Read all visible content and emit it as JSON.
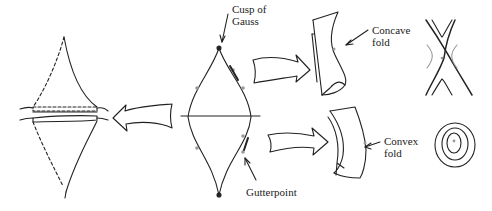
{
  "labels": {
    "cusp": "Cusp of\nGauss",
    "concave": "Concave\nfold",
    "convex": "Convex\nfold",
    "gutter": "Gutterpoint"
  },
  "colors": {
    "stroke": "#222222",
    "highlight": "#999999",
    "background": "#ffffff"
  }
}
